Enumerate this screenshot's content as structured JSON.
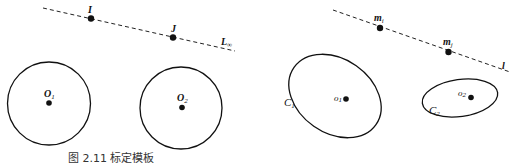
{
  "diagram": {
    "type": "projective-geometry-illustration",
    "left_panel": {
      "line": {
        "label": "L",
        "label_sub": "∞",
        "style": "dashed"
      },
      "points": [
        {
          "label": "I"
        },
        {
          "label": "J"
        }
      ],
      "circles": [
        {
          "label": "O",
          "label_sub": "1"
        },
        {
          "label": "O",
          "label_sub": "2"
        }
      ]
    },
    "right_panel": {
      "line": {
        "label": "l",
        "style": "dashed"
      },
      "points": [
        {
          "label": "m",
          "label_sub": "i"
        },
        {
          "label": "m",
          "label_sub": "j"
        }
      ],
      "ellipses": [
        {
          "label": "C",
          "label_sub": "1",
          "center_label": "o",
          "center_sub": "1"
        },
        {
          "label": "C",
          "label_sub": "2",
          "center_label": "o",
          "center_sub": "2"
        }
      ]
    },
    "caption": "图 2.11   标定模板"
  },
  "colors": {
    "stroke": "#111111",
    "background": "#ffffff"
  }
}
